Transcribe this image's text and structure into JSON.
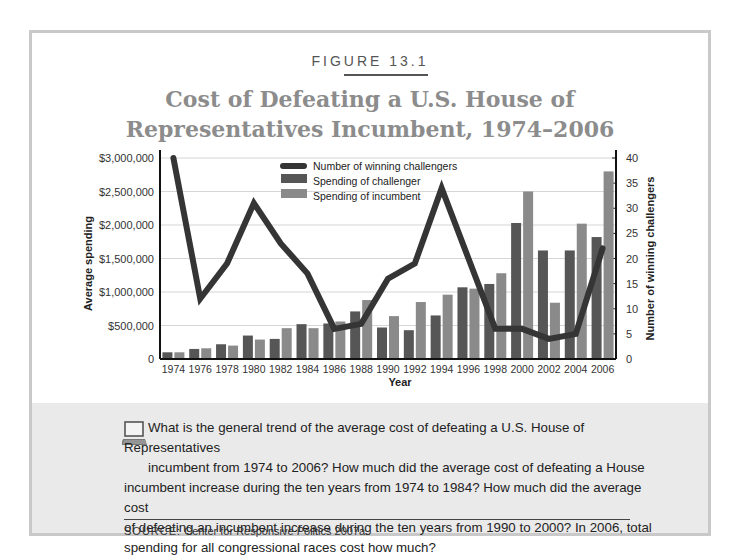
{
  "figure_label": "FIGURE 13.1",
  "title_line1": "Cost of Defeating a U.S. House of",
  "title_line2": "Representatives Incumbent, 1974–2006",
  "question": {
    "line1": "What is the general trend of the average cost of defeating a U.S. House of Representatives",
    "line2": "incumbent from 1974 to 2006? How much did the average cost of defeating a House",
    "line3": "incumbent increase during the ten years from 1974 to 1984? How much did the average cost",
    "line4": "of defeating an incumbent increase during the ten years from 1990 to 2000? In 2006, total",
    "line5": "spending for all congressional races cost how much?",
    "icon": "computer-icon"
  },
  "source": {
    "label": "SOURCE:",
    "text": "Center for Responsive Politics 2007a."
  },
  "colors": {
    "challenger": "#565656",
    "incumbent": "#8a8a8a",
    "line": "#353535",
    "title": "#8c8c8c",
    "panel": "#eaeaea",
    "frame": "#c9c9c9"
  },
  "chart_data": {
    "type": "bar",
    "title": "Cost of Defeating a U.S. House of Representatives Incumbent, 1974–2006",
    "xlabel": "Year",
    "ylabel": "Average spending",
    "y2label": "Number of winning challengers",
    "categories": [
      "1974",
      "1976",
      "1978",
      "1980",
      "1982",
      "1984",
      "1986",
      "1988",
      "1990",
      "1992",
      "1994",
      "1996",
      "1998",
      "2000",
      "2002",
      "2004",
      "2006"
    ],
    "ylim": [
      0,
      3000000
    ],
    "y2lim": [
      0,
      40
    ],
    "yticks": [
      "0",
      "$500,000",
      "$1,000,000",
      "$1,500,000",
      "$2,000,000",
      "$2,500,000",
      "$3,000,000"
    ],
    "y2ticks": [
      "0",
      "5",
      "10",
      "15",
      "20",
      "25",
      "30",
      "35",
      "40"
    ],
    "grid": true,
    "legend_position": "top-center",
    "series": [
      {
        "name": "Number of winning challengers",
        "type": "line",
        "axis": "right",
        "values": [
          40,
          12,
          19,
          31,
          23,
          17,
          6,
          7,
          16,
          19,
          34,
          20,
          6,
          6,
          4,
          5,
          22
        ]
      },
      {
        "name": "Spending of challenger",
        "type": "bar",
        "axis": "left",
        "values": [
          100000,
          150000,
          220000,
          350000,
          300000,
          520000,
          530000,
          710000,
          470000,
          430000,
          650000,
          1070000,
          1120000,
          2030000,
          1620000,
          1620000,
          1820000
        ]
      },
      {
        "name": "Spending of incumbent",
        "type": "bar",
        "axis": "left",
        "values": [
          100000,
          160000,
          200000,
          290000,
          460000,
          460000,
          560000,
          880000,
          640000,
          850000,
          960000,
          1050000,
          1280000,
          2500000,
          840000,
          2020000,
          2800000
        ]
      }
    ]
  }
}
